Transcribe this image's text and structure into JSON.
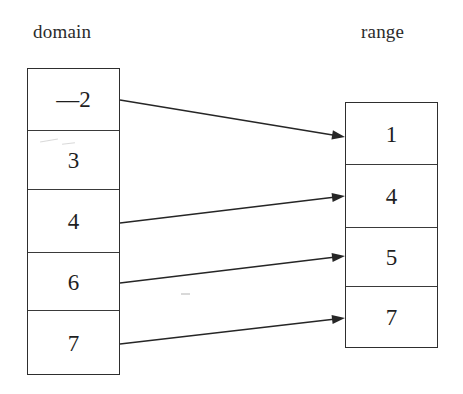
{
  "diagram": {
    "title_domain": "domain",
    "title_range": "range",
    "domain_values": [
      "—2",
      "3",
      "4",
      "6",
      "7"
    ],
    "range_values": [
      "1",
      "4",
      "5",
      "7"
    ],
    "mappings": [
      {
        "from": "—2",
        "to": "1",
        "x1": 120,
        "y1": 100,
        "x2": 345,
        "y2": 137
      },
      {
        "from": "4",
        "to": "4",
        "x1": 120,
        "y1": 223,
        "x2": 345,
        "y2": 196
      },
      {
        "from": "6",
        "to": "5",
        "x1": 120,
        "y1": 283,
        "x2": 345,
        "y2": 256
      },
      {
        "from": "7",
        "to": "7",
        "x1": 120,
        "y1": 344,
        "x2": 345,
        "y2": 318
      }
    ],
    "colors": {
      "background": "#ffffff",
      "ink": "#262626",
      "box_border": "#2e2e2e",
      "text": "#1f1f1f"
    }
  }
}
